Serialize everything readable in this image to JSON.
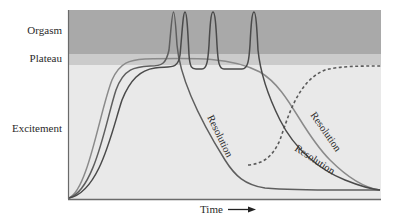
{
  "diagram": {
    "type": "sexual-response-cycle",
    "y_labels": {
      "orgasm": "Orgasm",
      "plateau": "Plateau",
      "excitement": "Excitement"
    },
    "x_label": "Time",
    "curve_labels": {
      "resolution_1": "Resolution",
      "resolution_2": "Resolution",
      "resolution_3": "Resolution"
    },
    "colors": {
      "orgasm_band": "#a9a9a9",
      "plateau_band": "#cbcbcb",
      "excitement_band": "#e9e9e9",
      "curve_dark": "#4a4a4a",
      "curve_mid": "#5e5e5e",
      "curve_light": "#8a8a8a",
      "axis": "#6a6a6a"
    },
    "curves": [
      {
        "name": "single-orgasm",
        "peaks": 1,
        "note": "one orgasm then rapid resolution, dashed branch returns to plateau"
      },
      {
        "name": "multiple-orgasm",
        "peaks": 3,
        "note": "three orgasms separated by plateau, then resolution"
      },
      {
        "name": "plateau-only",
        "peaks": 0,
        "note": "remains at plateau, slow resolution"
      }
    ]
  }
}
